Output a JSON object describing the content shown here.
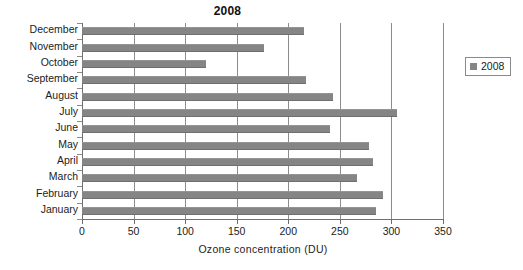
{
  "chart_data": {
    "type": "bar",
    "orientation": "horizontal",
    "title": "2008",
    "xlabel": "Ozone  concentration (DU)",
    "ylabel": "",
    "xlim": [
      0,
      350
    ],
    "xticks": [
      0,
      50,
      100,
      150,
      200,
      250,
      300,
      350
    ],
    "grid": true,
    "legend_position": "right",
    "series": [
      {
        "name": "2008",
        "color": "#858585",
        "values": [
          285,
          292,
          267,
          282,
          278,
          240,
          305,
          243,
          217,
          120,
          176,
          215
        ]
      }
    ],
    "categories": [
      "January",
      "February",
      "March",
      "April",
      "May",
      "June",
      "July",
      "August",
      "September",
      "October",
      "November",
      "December"
    ],
    "categories_display_order_top_to_bottom": [
      "December",
      "November",
      "October",
      "September",
      "August",
      "July",
      "June",
      "May",
      "April",
      "March",
      "February",
      "January"
    ]
  },
  "legend": {
    "entries": [
      {
        "label": "2008",
        "color": "#858585"
      }
    ]
  },
  "colors": {
    "bar": "#858585",
    "gridline": "#8c8c8c",
    "axis": "#707070",
    "text": "#1c1c1c",
    "background": "#ffffff"
  }
}
